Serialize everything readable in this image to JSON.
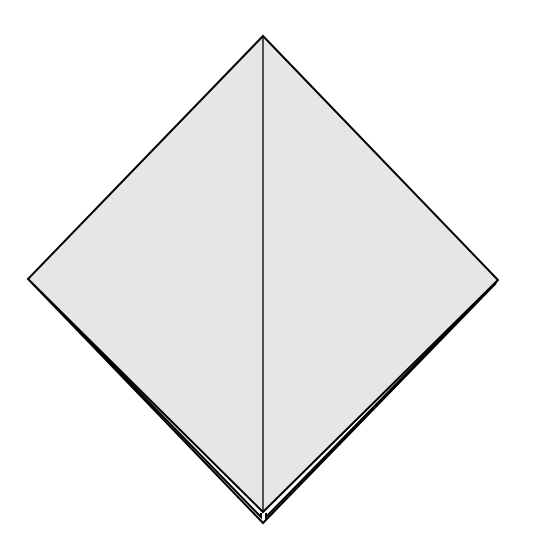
{
  "diagram": {
    "type": "origami-step",
    "colors": {
      "paper_fill": "#e6e6e6",
      "stroke": "#000000",
      "background": "#ffffff"
    },
    "shape": {
      "top": [
        263,
        36
      ],
      "right": [
        498,
        280
      ],
      "bottom": [
        263,
        523
      ],
      "left": [
        28,
        279
      ]
    },
    "center_crease": {
      "from": [
        263,
        36
      ],
      "to": [
        263,
        512
      ]
    }
  }
}
